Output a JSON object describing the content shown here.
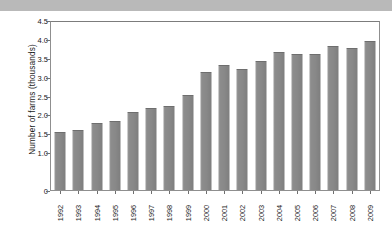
{
  "figure": {
    "cut_title": "Number of organic farms in the UK, 1992-2009",
    "background_color": "#ffffff",
    "bar_color": "#8a8a8a",
    "axis_color": "#8f8f8f"
  },
  "chart_data": {
    "type": "bar",
    "title": "",
    "xlabel": "",
    "ylabel": "Number of farms (thousands)",
    "categories": [
      "1992",
      "1993",
      "1994",
      "1995",
      "1996",
      "1997",
      "1998",
      "1999",
      "2000",
      "2001",
      "2002",
      "2003",
      "2004",
      "2005",
      "2006",
      "2007",
      "2008",
      "2009"
    ],
    "values": [
      1.55,
      1.6,
      1.8,
      1.85,
      2.1,
      2.2,
      2.25,
      2.55,
      3.15,
      3.35,
      3.25,
      3.45,
      3.7,
      3.65,
      3.65,
      3.85,
      3.8,
      4.0
    ],
    "ylim": [
      0,
      4.5
    ],
    "ytick_labels": [
      "4.5",
      "4.0",
      "3.5",
      "3.0",
      "2.5",
      "2.0",
      "1.5",
      "1.0",
      "0"
    ],
    "ytick_values": [
      4.5,
      4.0,
      3.5,
      3.0,
      2.5,
      2.0,
      1.5,
      1.0,
      0
    ],
    "grid": false,
    "legend": null,
    "legend_position": "none",
    "series": [
      {
        "name": "Number of farms (thousands)",
        "values": [
          1.55,
          1.6,
          1.8,
          1.85,
          2.1,
          2.2,
          2.25,
          2.55,
          3.15,
          3.35,
          3.25,
          3.45,
          3.7,
          3.65,
          3.65,
          3.85,
          3.8,
          4.0
        ]
      }
    ]
  }
}
